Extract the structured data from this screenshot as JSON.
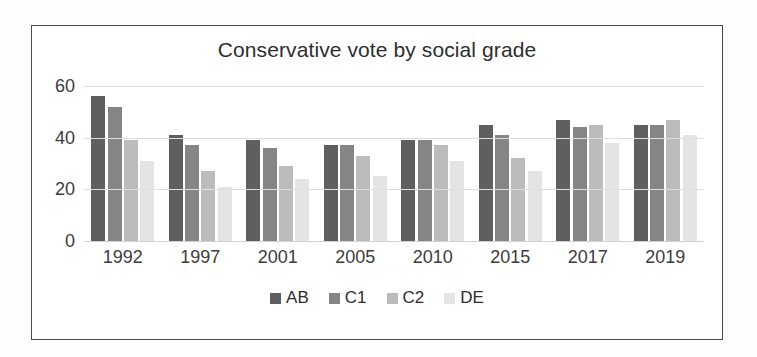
{
  "chart_data": {
    "type": "bar",
    "title": "Conservative vote by social grade",
    "xlabel": "",
    "ylabel": "",
    "ylim": [
      0,
      60
    ],
    "yticks": [
      0,
      20,
      40,
      60
    ],
    "ytick_labels": [
      "0",
      "20",
      "40",
      "60"
    ],
    "grid": true,
    "legend_position": "bottom",
    "categories": [
      "1992",
      "1997",
      "2001",
      "2005",
      "2010",
      "2015",
      "2017",
      "2019"
    ],
    "series": [
      {
        "name": "AB",
        "color": "#5f5f5f",
        "values": [
          56,
          41,
          39,
          37,
          39,
          45,
          47,
          45
        ]
      },
      {
        "name": "C1",
        "color": "#858585",
        "values": [
          52,
          37,
          36,
          37,
          39,
          41,
          44,
          45
        ]
      },
      {
        "name": "C2",
        "color": "#bcbcbc",
        "values": [
          39,
          27,
          29,
          33,
          37,
          32,
          45,
          47
        ]
      },
      {
        "name": "DE",
        "color": "#e4e4e4",
        "values": [
          31,
          21,
          24,
          25,
          31,
          27,
          38,
          41
        ]
      }
    ]
  },
  "frame": {
    "border_color": "#4a4a4a",
    "background": "#ffffff"
  }
}
